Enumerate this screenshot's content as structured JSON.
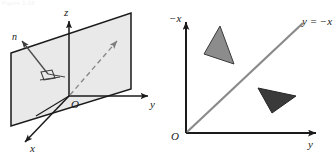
{
  "figure": {
    "caption_fragment": "Figure 1-18",
    "panel_count": 2
  },
  "left_panel": {
    "name": "plane-containing-z-axis-3d-diagram",
    "description": "Three-dimensional coordinate system with a shaded plane containing the z-axis, its normal vector n, and a dashed direction arrow from the origin.",
    "axes": [
      {
        "id": "z",
        "label": "z",
        "orientation": "vertical-up"
      },
      {
        "id": "y",
        "label": "y",
        "orientation": "horizontal-right"
      },
      {
        "id": "x",
        "label": "x",
        "orientation": "diagonal-down-left"
      }
    ],
    "origin_label": "O",
    "normal_vector_label": "n",
    "right_angle_marker": true,
    "dashed_arrow": true,
    "plane_fill_color": "#e9e9e9",
    "plane_stroke_color": "#1a1a1a",
    "axis_color": "#1a1a1a"
  },
  "right_panel": {
    "name": "line-y-equals-minus-x-2d-diagram",
    "description": "Two-dimensional plot with a vertical negative-x axis and horizontal y axis, the line y = -x, and two shaded triangles on opposite sides of the line.",
    "axes": [
      {
        "id": "neg-x",
        "label": "−x",
        "orientation": "vertical-up"
      },
      {
        "id": "y",
        "label": "y",
        "orientation": "horizontal-right"
      }
    ],
    "origin_label": "O",
    "line_label": "y = −x",
    "line_color": "#8a8a8a",
    "axis_color": "#1a1a1a",
    "shapes": [
      {
        "name": "upper-left-triangle",
        "fill": "#8c8c8c",
        "stroke": "#3a3a3a"
      },
      {
        "name": "lower-right-triangle",
        "fill": "#3a3a3a",
        "stroke": "#262626"
      }
    ]
  }
}
